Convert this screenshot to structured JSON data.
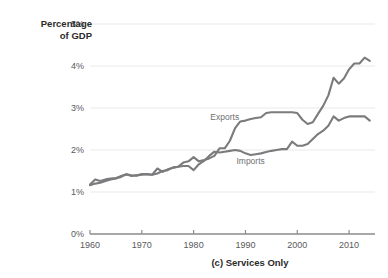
{
  "chart_data": {
    "type": "line",
    "title": "",
    "caption": "(c) Services Only",
    "ylabel_line1": "Percentage",
    "ylabel_line2": "of GDP",
    "xlabel": "",
    "xlim": [
      1960,
      2015
    ],
    "ylim": [
      0,
      5
    ],
    "grid": true,
    "grid_axis": "y",
    "legend": "inline-annotations",
    "yticks": [
      "0%",
      "1%",
      "2%",
      "3%",
      "4%",
      "5%"
    ],
    "ytick_values": [
      0,
      1,
      2,
      3,
      4,
      5
    ],
    "xticks": [
      "1960",
      "1970",
      "1980",
      "1990",
      "2000",
      "2010"
    ],
    "xtick_values": [
      1960,
      1970,
      1980,
      1990,
      2000,
      2010
    ],
    "series_color": "#7b7b7d",
    "gridline_color": "#e9e9ea",
    "axis_color": "#8b8b8d",
    "x": [
      1960,
      1961,
      1962,
      1963,
      1964,
      1965,
      1966,
      1967,
      1968,
      1969,
      1970,
      1971,
      1972,
      1973,
      1974,
      1975,
      1976,
      1977,
      1978,
      1979,
      1980,
      1981,
      1982,
      1983,
      1984,
      1985,
      1986,
      1987,
      1988,
      1989,
      1990,
      1991,
      1992,
      1993,
      1994,
      1995,
      1996,
      1997,
      1998,
      1999,
      2000,
      2001,
      2002,
      2003,
      2004,
      2005,
      2006,
      2007,
      2008,
      2009,
      2010,
      2011,
      2012,
      2013,
      2014
    ],
    "series": [
      {
        "name": "Exports",
        "label": "Exports",
        "label_x": 1986,
        "label_y": 2.72,
        "values": [
          1.18,
          1.3,
          1.26,
          1.3,
          1.32,
          1.33,
          1.36,
          1.42,
          1.4,
          1.39,
          1.42,
          1.43,
          1.41,
          1.56,
          1.48,
          1.54,
          1.58,
          1.6,
          1.7,
          1.73,
          1.83,
          1.73,
          1.76,
          1.8,
          1.86,
          2.04,
          2.04,
          2.22,
          2.52,
          2.68,
          2.7,
          2.74,
          2.76,
          2.78,
          2.88,
          2.9,
          2.9,
          2.9,
          2.9,
          2.9,
          2.88,
          2.72,
          2.62,
          2.66,
          2.86,
          3.05,
          3.3,
          3.72,
          3.58,
          3.7,
          3.92,
          4.06,
          4.06,
          4.2,
          4.12
        ]
      },
      {
        "name": "Imports",
        "label": "Imports",
        "label_x": 1991,
        "label_y": 1.66,
        "values": [
          1.16,
          1.2,
          1.22,
          1.26,
          1.3,
          1.32,
          1.38,
          1.42,
          1.38,
          1.4,
          1.42,
          1.42,
          1.41,
          1.44,
          1.5,
          1.52,
          1.58,
          1.6,
          1.62,
          1.62,
          1.52,
          1.66,
          1.74,
          1.86,
          1.96,
          1.94,
          1.96,
          1.98,
          2.0,
          1.98,
          1.92,
          1.88,
          1.9,
          1.92,
          1.95,
          1.98,
          2.0,
          2.02,
          2.02,
          2.2,
          2.1,
          2.1,
          2.14,
          2.26,
          2.38,
          2.46,
          2.58,
          2.8,
          2.7,
          2.76,
          2.8,
          2.8,
          2.8,
          2.8,
          2.7
        ]
      }
    ]
  }
}
